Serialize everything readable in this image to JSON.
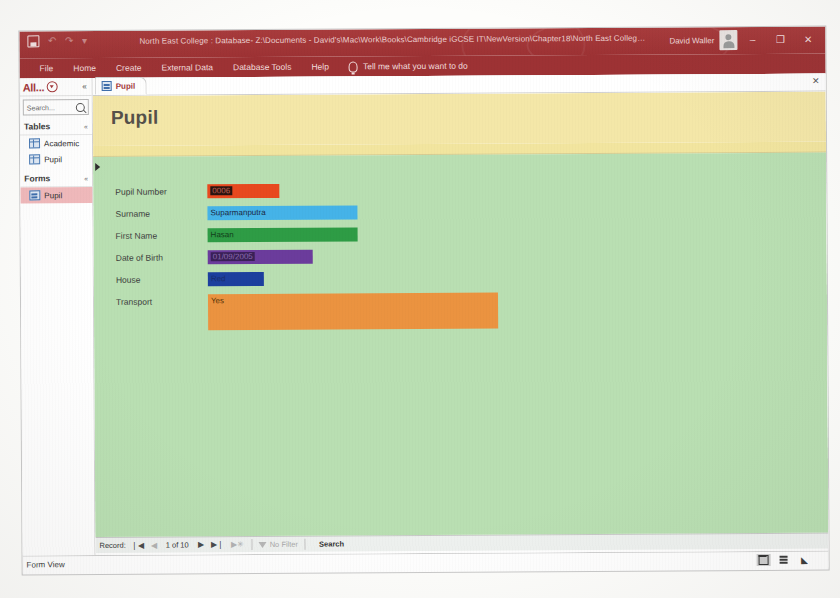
{
  "window": {
    "title": "North East College : Database- Z:\\Documents - David's\\Mac\\Work\\Books\\Cambridge iGCSE IT\\NewVersion\\Chapter18\\North East College.accdb (Access 2016) - Ac...",
    "account_name": "David Waller",
    "minimize_label": "–",
    "maximize_label": "❐",
    "close_label": "✕",
    "qat": {
      "save_label": "Save",
      "undo_label": "↶",
      "redo_label": "↷",
      "customize_label": "▾"
    }
  },
  "ribbon": {
    "tabs": [
      {
        "label": "File"
      },
      {
        "label": "Home"
      },
      {
        "label": "Create"
      },
      {
        "label": "External Data"
      },
      {
        "label": "Database Tools"
      },
      {
        "label": "Help"
      }
    ],
    "tell_me": "Tell me what you want to do"
  },
  "navpane": {
    "title": "All...",
    "collapse_label": "«",
    "search_placeholder": "Search...",
    "groups": [
      {
        "label": "Tables",
        "chevron": "«",
        "items": [
          {
            "label": "Academic",
            "selected": false
          },
          {
            "label": "Pupil",
            "selected": false
          }
        ]
      },
      {
        "label": "Forms",
        "chevron": "«",
        "items": [
          {
            "label": "Pupil",
            "selected": true
          }
        ]
      }
    ]
  },
  "document": {
    "tab_label": "Pupil",
    "close_label": "✕"
  },
  "form": {
    "header_title": "Pupil",
    "fields": [
      {
        "label": "Pupil Number",
        "value": "",
        "selected_value": "0006",
        "box_width": 72,
        "bg": "#e8491f",
        "top": 28
      },
      {
        "label": "Surname",
        "value": "Suparmanputra",
        "selected_value": "",
        "box_width": 150,
        "bg": "#45b3e8",
        "top": 50
      },
      {
        "label": "First Name",
        "value": "Hasan",
        "selected_value": "",
        "box_width": 150,
        "bg": "#2e9c45",
        "top": 72
      },
      {
        "label": "Date of Birth",
        "value": "",
        "selected_value": "01/09/2005",
        "box_width": 105,
        "bg": "#6b3c9c",
        "top": 94
      },
      {
        "label": "House",
        "value": "Red",
        "selected_value": "",
        "box_width": 56,
        "bg": "#1c3f9e",
        "top": 116
      },
      {
        "label": "Transport",
        "value": "Yes",
        "selected_value": "",
        "box_width": 290,
        "bg": "#eb9340",
        "top": 138,
        "box_height": 36
      }
    ]
  },
  "recordnav": {
    "label": "Record:",
    "first_label": "❘◀",
    "prev_label": "◀",
    "counter": "1 of 10",
    "next_label": "▶",
    "last_label": "▶❘",
    "new_label": "▶✳",
    "filter_label": "No Filter",
    "search_label": "Search"
  },
  "statusbar": {
    "view_label": "Form View",
    "views": [
      {
        "name": "form-view",
        "active": true
      },
      {
        "name": "layout-view",
        "active": false
      },
      {
        "name": "design-view",
        "active": false
      }
    ]
  }
}
